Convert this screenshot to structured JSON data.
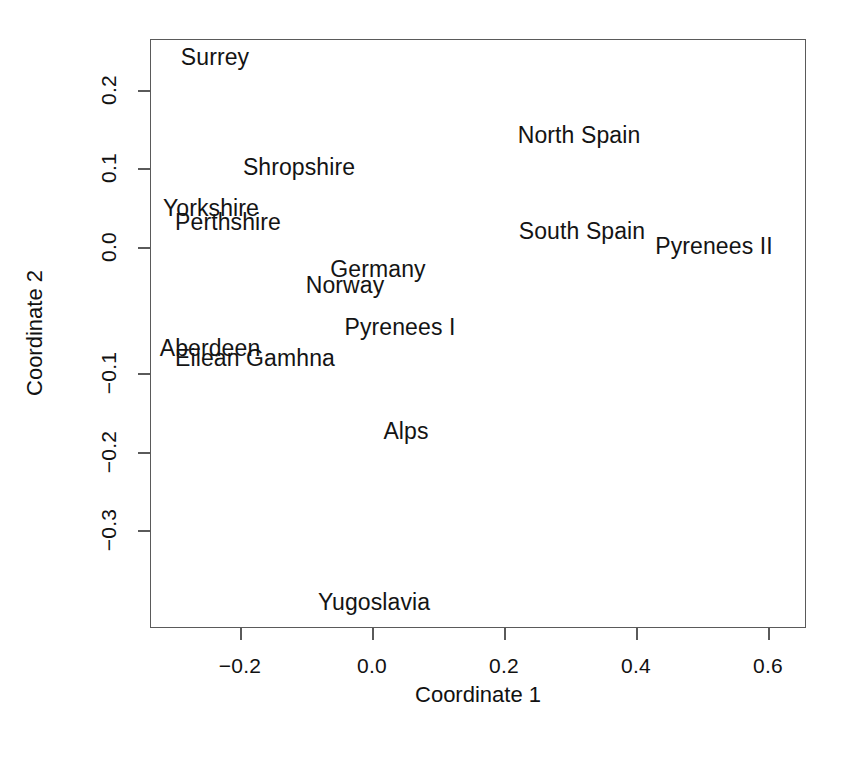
{
  "chart_data": {
    "type": "scatter",
    "title": "",
    "xlabel": "Coordinate 1",
    "ylabel": "Coordinate 2",
    "xlim": [
      -0.336,
      0.658
    ],
    "ylim": [
      -0.368,
      0.249
    ],
    "grid": false,
    "legend": "none",
    "marker": "text-label",
    "xticks": [
      "-0.2",
      "0.0",
      "0.2",
      "0.4",
      "0.6"
    ],
    "xtick_values": [
      -0.2,
      0.0,
      0.2,
      0.4,
      0.6
    ],
    "yticks": [
      "0.2",
      "0.1",
      "0.0",
      "-0.1",
      "-0.2",
      "-0.3"
    ],
    "ytick_values": [
      0.2,
      0.1,
      0.0,
      -0.1,
      -0.2,
      -0.3
    ],
    "points": [
      {
        "label": "Surrey",
        "x": -0.238,
        "y": 0.216
      },
      {
        "label": "North Spain",
        "x": 0.314,
        "y": 0.127
      },
      {
        "label": "Shropshire",
        "x": -0.111,
        "y": 0.091
      },
      {
        "label": "Yorkshire",
        "x": -0.244,
        "y": 0.044
      },
      {
        "label": "Perthshire",
        "x": -0.218,
        "y": 0.028
      },
      {
        "label": "South Spain",
        "x": 0.318,
        "y": 0.018
      },
      {
        "label": "Pyrenees II",
        "x": 0.518,
        "y": 0.001
      },
      {
        "label": "Germany",
        "x": 0.009,
        "y": -0.025
      },
      {
        "label": "Norway",
        "x": -0.041,
        "y": -0.043
      },
      {
        "label": "Pyrenees I",
        "x": 0.042,
        "y": -0.091
      },
      {
        "label": "Aberdeen",
        "x": -0.276,
        "y": -0.102
      },
      {
        "label": "Eilean Gamhna",
        "x": -0.209,
        "y": -0.114
      },
      {
        "label": "Alps",
        "x": 0.052,
        "y": -0.209
      },
      {
        "label": "Yugoslavia",
        "x": 0.003,
        "y": -0.403
      }
    ],
    "point_positions_px": [
      {
        "label": "Surrey",
        "cx": 215,
        "cy": 57
      },
      {
        "label": "North Spain",
        "cx": 579,
        "cy": 135
      },
      {
        "label": "Shropshire",
        "cx": 299,
        "cy": 167
      },
      {
        "label": "Yorkshire",
        "cx": 211,
        "cy": 208
      },
      {
        "label": "Perthshire",
        "cx": 228,
        "cy": 222
      },
      {
        "label": "South Spain",
        "cx": 582,
        "cy": 231
      },
      {
        "label": "Pyrenees II",
        "cx": 714,
        "cy": 246
      },
      {
        "label": "Germany",
        "cx": 378,
        "cy": 269
      },
      {
        "label": "Norway",
        "cx": 345,
        "cy": 285
      },
      {
        "label": "Pyrenees I",
        "cx": 400,
        "cy": 327
      },
      {
        "label": "Aberdeen",
        "cx": 210,
        "cy": 348
      },
      {
        "label": "Eilean Gamhna",
        "cx": 255,
        "cy": 358
      },
      {
        "label": "Alps",
        "cx": 406,
        "cy": 431
      },
      {
        "label": "Yugoslavia",
        "cx": 374,
        "cy": 602
      }
    ]
  },
  "axes": {
    "x_title": "Coordinate 1",
    "y_title": "Coordinate 2",
    "x_ticks": [
      {
        "text": "-0.2",
        "px": 240
      },
      {
        "text": "0.0",
        "px": 372
      },
      {
        "text": "0.2",
        "px": 504
      },
      {
        "text": "0.4",
        "px": 636
      },
      {
        "text": "0.6",
        "px": 768
      }
    ],
    "y_ticks": [
      {
        "text": "0.2",
        "py": 90
      },
      {
        "text": "0.1",
        "py": 168
      },
      {
        "text": "0.0",
        "py": 247
      },
      {
        "text": "-0.1",
        "py": 373
      },
      {
        "text": "-0.2",
        "py": 452
      },
      {
        "text": "-0.3",
        "py": 530
      }
    ]
  },
  "colors": {
    "background": "#ffffff",
    "frame": "#5a5a5a",
    "text": "#141414"
  }
}
